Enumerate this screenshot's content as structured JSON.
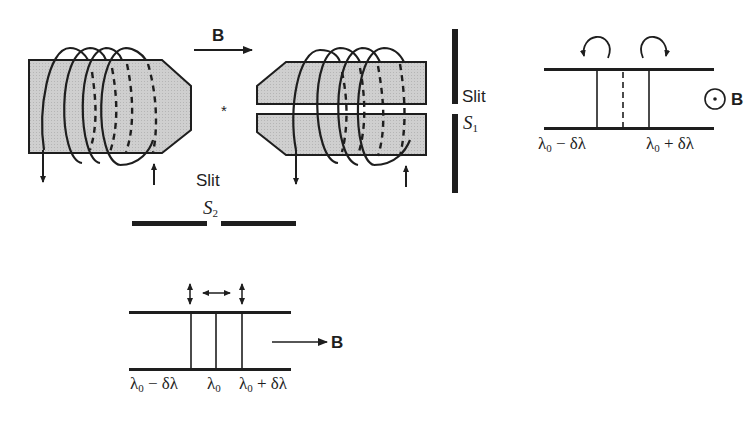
{
  "figure": {
    "field_label": "B",
    "star_mark": "*",
    "slit1": {
      "label": "Slit",
      "symbol": "S",
      "subscript": "1"
    },
    "slit2": {
      "label": "Slit",
      "symbol": "S",
      "subscript": "2"
    }
  },
  "transverse_pattern": {
    "field_label": "B",
    "field_direction": "out-of-page",
    "lines": [
      "λ0 − δλ",
      "λ0 + δλ"
    ],
    "left_label": {
      "base": "λ",
      "sub": "0",
      "rest": " − δλ"
    },
    "right_label": {
      "base": "λ",
      "sub": "0",
      "rest": " + δλ"
    },
    "polarization": [
      "circular-ccw",
      "circular-cw"
    ]
  },
  "longitudinal_pattern": {
    "field_label": "B",
    "field_direction": "right",
    "left_label": {
      "base": "λ",
      "sub": "0",
      "rest": " − δλ"
    },
    "center_label": {
      "base": "λ",
      "sub": "0",
      "rest": ""
    },
    "right_label": {
      "base": "λ",
      "sub": "0",
      "rest": " + δλ"
    },
    "polarization": [
      "vertical",
      "horizontal",
      "vertical"
    ]
  },
  "colors": {
    "ink": "#1e1e1e",
    "core_fill": "#c8c8c8"
  }
}
